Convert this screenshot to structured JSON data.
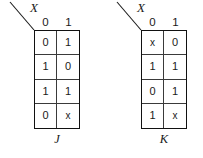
{
  "figure": {
    "background_color": "#ffffff",
    "line_color": "#111111",
    "text_color": "#1a1a1a"
  },
  "maps": [
    {
      "id": "j",
      "variable_label": "X",
      "function_label": "J",
      "column_headers": [
        "0",
        "1"
      ],
      "rows": [
        [
          "0",
          "1"
        ],
        [
          "1",
          "0"
        ],
        [
          "1",
          "1"
        ],
        [
          "0",
          "x"
        ]
      ]
    },
    {
      "id": "k",
      "variable_label": "X",
      "function_label": "K",
      "column_headers": [
        "0",
        "1"
      ],
      "rows": [
        [
          "x",
          "0"
        ],
        [
          "1",
          "1"
        ],
        [
          "0",
          "1"
        ],
        [
          "1",
          "x"
        ]
      ]
    }
  ]
}
